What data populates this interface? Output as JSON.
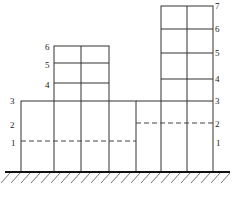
{
  "diagram": {
    "type": "building-elevation",
    "left_block_labels": [
      "1",
      "2",
      "3"
    ],
    "middle_tower_labels": [
      "4",
      "5",
      "6"
    ],
    "right_block_labels": [
      "1",
      "2",
      "3"
    ],
    "right_tower_labels": [
      "4",
      "5",
      "6",
      "7"
    ],
    "ground": "hatched-ground"
  }
}
